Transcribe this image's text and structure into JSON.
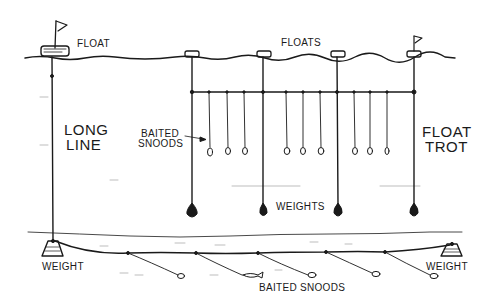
{
  "diagram": {
    "style": "black ink line drawing on white",
    "colors": {
      "ink": "#1a1a1a",
      "background": "#ffffff",
      "faint": "#bdbdbd"
    },
    "labels": {
      "float": "FLOAT",
      "floats": "FLOATS",
      "long_line": [
        "LONG",
        "LINE"
      ],
      "float_trot": [
        "FLOAT",
        "TROT"
      ],
      "baited_snoods_trot": [
        "BAITED",
        "SNOODS"
      ],
      "weights": "WEIGHTS",
      "weight_left": "WEIGHT",
      "weight_right": "WEIGHT",
      "baited_snoods_bottom": "BAITED SNOODS"
    },
    "components": {
      "long_line": {
        "float": "float-with-flag",
        "anchors": [
          "weight-left",
          "weight-right"
        ],
        "snood_count": 5
      },
      "float_trot": {
        "float_count": 4,
        "flagged_float_index": 3,
        "weight_count": 4,
        "snood_count": 9
      }
    }
  }
}
